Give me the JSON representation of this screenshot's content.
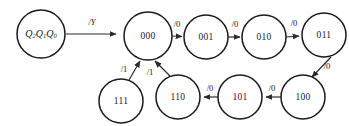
{
  "diagram": {
    "type": "finite-state-machine-transition-diagram",
    "width": 349,
    "height": 126,
    "background_color": "#ffffff",
    "stroke_color": "#1a1a1a",
    "edge_color": "#2b2b2b",
    "register_label": {
      "base": "Q",
      "sub2": "2",
      "sub1": "1",
      "sub0": "0",
      "full_text": "Q2Q1Q0"
    },
    "states": [
      {
        "id": "reg",
        "label": "Q2Q1Q0",
        "cx": 41,
        "cy": 34,
        "r": 24,
        "italic": true
      },
      {
        "id": "s000",
        "label": "000",
        "cx": 148,
        "cy": 36,
        "r": 24,
        "italic": false
      },
      {
        "id": "s001",
        "label": "001",
        "cx": 206,
        "cy": 37,
        "r": 22,
        "italic": false
      },
      {
        "id": "s010",
        "label": "010",
        "cx": 264,
        "cy": 37,
        "r": 22,
        "italic": false
      },
      {
        "id": "s011",
        "label": "011",
        "cx": 324,
        "cy": 35,
        "r": 22,
        "italic": false
      },
      {
        "id": "s100",
        "label": "100",
        "cx": 303,
        "cy": 97,
        "r": 22,
        "italic": false
      },
      {
        "id": "s101",
        "label": "101",
        "cx": 240,
        "cy": 97,
        "r": 22,
        "italic": false
      },
      {
        "id": "s110",
        "label": "110",
        "cx": 178,
        "cy": 97,
        "r": 22,
        "italic": false
      },
      {
        "id": "s111",
        "label": "111",
        "cx": 121,
        "cy": 101,
        "r": 22,
        "italic": false
      }
    ],
    "transitions": [
      {
        "id": "t-reg-out",
        "from": "reg",
        "to": null,
        "label": "/Y",
        "italic": true,
        "label_x": 92,
        "label_y": 23
      },
      {
        "id": "t-000-001",
        "from": "s000",
        "to": "s001",
        "label": "/0",
        "italic": false,
        "label_x": 177,
        "label_y": 25
      },
      {
        "id": "t-001-010",
        "from": "s001",
        "to": "s010",
        "label": "/0",
        "italic": false,
        "label_x": 235,
        "label_y": 25
      },
      {
        "id": "t-010-011",
        "from": "s010",
        "to": "s011",
        "label": "/0",
        "italic": false,
        "label_x": 294,
        "label_y": 24
      },
      {
        "id": "t-011-100",
        "from": "s011",
        "to": "s100",
        "label": "/0",
        "italic": false,
        "label_x": 327,
        "label_y": 67
      },
      {
        "id": "t-100-101",
        "from": "s100",
        "to": "s101",
        "label": "/0",
        "italic": false,
        "label_x": 272,
        "label_y": 89
      },
      {
        "id": "t-101-110",
        "from": "s101",
        "to": "s110",
        "label": "/0",
        "italic": false,
        "label_x": 210,
        "label_y": 89
      },
      {
        "id": "t-110-000",
        "from": "s110",
        "to": "s000",
        "label": "/1",
        "italic": false,
        "label_x": 150,
        "label_y": 73
      },
      {
        "id": "t-111-000",
        "from": "s111",
        "to": "s000",
        "label": "/1",
        "italic": false,
        "label_x": 124,
        "label_y": 70
      }
    ]
  }
}
